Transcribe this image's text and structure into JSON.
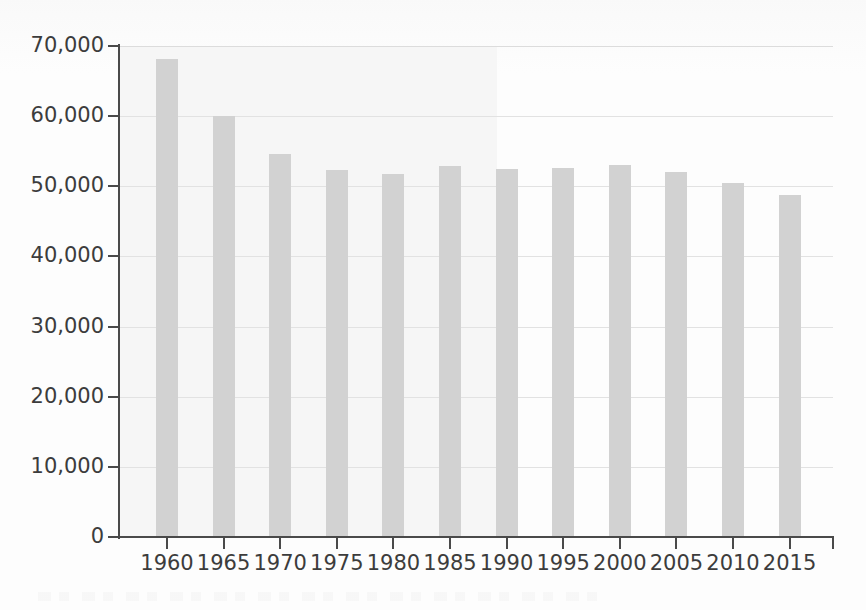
{
  "chart_data": {
    "type": "bar",
    "title": "",
    "subtitle": "",
    "xlabel": "",
    "ylabel": "",
    "categories": [
      "1960",
      "1965",
      "1970",
      "1975",
      "1980",
      "1985",
      "1990",
      "1995",
      "2000",
      "2005",
      "2010",
      "2015"
    ],
    "values": [
      68100,
      60000,
      54600,
      52300,
      51700,
      52900,
      52400,
      52600,
      53100,
      52100,
      50400,
      48700
    ],
    "series": [
      {
        "name": "",
        "values": [
          68100,
          60000,
          54600,
          52300,
          51700,
          52900,
          52400,
          52600,
          53100,
          52100,
          50400,
          48700
        ]
      }
    ],
    "ylim": [
      0,
      70000
    ],
    "y_ticks": [
      0,
      10000,
      20000,
      30000,
      40000,
      50000,
      60000,
      70000
    ],
    "y_tick_labels": [
      "0",
      "10,000",
      "20,000",
      "30,000",
      "40,000",
      "50,000",
      "60,000",
      "70,000"
    ],
    "x_tick_labels": [
      "1960",
      "1965",
      "1970",
      "1975",
      "1980",
      "1985",
      "1990",
      "1995",
      "2000",
      "2005",
      "2010",
      "2015"
    ],
    "grid": true,
    "grid_axis": "y",
    "legend": false,
    "legend_position": "none",
    "annotations": []
  },
  "style": {
    "bar_color": "#d2d2d2",
    "gridline_color": "#e2e2e2",
    "axis_color": "#4a4a4a",
    "text_color": "#3c3c3c",
    "background_color": "#fdfdfd",
    "scan_wash_color": "#f6f6f6"
  },
  "geometry": {
    "plot_left": 119,
    "plot_right": 833,
    "plot_top": 46,
    "plot_bottom": 537,
    "bar_width": 22,
    "first_tick_x": 167,
    "tick_spacing": 56.6
  }
}
